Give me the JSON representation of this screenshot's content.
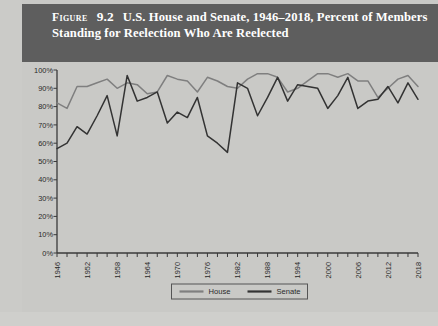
{
  "figure": {
    "label": "Figure",
    "number": "9.2",
    "title": "U.S. House and Senate, 1946–2018, Percent of Members Standing for Reelection Who Are Reelected"
  },
  "colors": {
    "header_background": "#5e5e5e",
    "header_text": "#ffffff",
    "plot_background": "#c9c9c6",
    "house_line": "#7f7f7f",
    "senate_line": "#333333",
    "axis": "#3a3a3a"
  },
  "legend": {
    "position": "bottom-center",
    "entries": [
      {
        "name": "House",
        "color": "#7f7f7f"
      },
      {
        "name": "Senate",
        "color": "#333333"
      }
    ]
  },
  "chart_data": {
    "type": "line",
    "title": "U.S. House and Senate, 1946–2018, Percent of Members Standing for Reelection Who Are Reelected",
    "xlabel": "",
    "ylabel": "",
    "grid": false,
    "legend_position": "bottom-center",
    "xlim": [
      1946,
      2018
    ],
    "ylim": [
      0,
      100
    ],
    "ytick_values": [
      0,
      10,
      20,
      30,
      40,
      50,
      60,
      70,
      80,
      90,
      100
    ],
    "ytick_labels": [
      "0%",
      "10%",
      "20%",
      "30%",
      "40%",
      "50%",
      "60%",
      "70%",
      "80%",
      "90%",
      "100%"
    ],
    "x": [
      1946,
      1948,
      1950,
      1952,
      1954,
      1956,
      1958,
      1960,
      1962,
      1964,
      1966,
      1968,
      1970,
      1972,
      1974,
      1976,
      1978,
      1980,
      1982,
      1984,
      1986,
      1988,
      1990,
      1992,
      1994,
      1996,
      1998,
      2000,
      2002,
      2004,
      2006,
      2008,
      2010,
      2012,
      2014,
      2016,
      2018
    ],
    "xtick_labels": [
      "1946",
      "1952",
      "1958",
      "1964",
      "1970",
      "1976",
      "1982",
      "1988",
      "1994",
      "2000",
      "2006",
      "2012",
      "2018"
    ],
    "xtick_values": [
      1946,
      1952,
      1958,
      1964,
      1970,
      1976,
      1982,
      1988,
      1994,
      2000,
      2006,
      2012,
      2018
    ],
    "series": [
      {
        "name": "House",
        "color": "#7f7f7f",
        "values": [
          82,
          79,
          91,
          91,
          93,
          95,
          90,
          93,
          92,
          87,
          88,
          97,
          95,
          94,
          88,
          96,
          94,
          91,
          90,
          95,
          98,
          98,
          96,
          88,
          90,
          94,
          98,
          98,
          96,
          98,
          94,
          94,
          85,
          90,
          95,
          97,
          91
        ]
      },
      {
        "name": "Senate",
        "color": "#333333",
        "values": [
          57,
          60,
          69,
          65,
          75,
          86,
          64,
          97,
          83,
          85,
          88,
          71,
          77,
          74,
          85,
          64,
          60,
          55,
          93,
          90,
          75,
          85,
          96,
          83,
          92,
          91,
          90,
          79,
          86,
          96,
          79,
          83,
          84,
          91,
          82,
          93,
          84
        ]
      }
    ]
  }
}
